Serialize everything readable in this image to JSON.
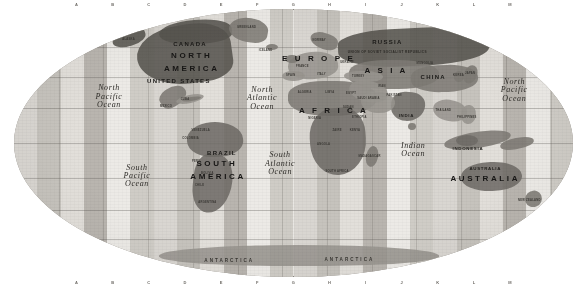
{
  "map": {
    "title": "World Time Zone Map",
    "projection": "Mollweide / elliptical equal-area",
    "background_color": "#ffffff",
    "ocean_base_color": "#e9e7e3",
    "land_color": "#6e6b66",
    "graticule_color": "#5a5854",
    "style": "grayscale photocopy / scanned print"
  },
  "continents": [
    {
      "label": "NORTH",
      "x": 31.8,
      "y": 17.5
    },
    {
      "label": "AMERICA",
      "x": 31.8,
      "y": 22.4
    },
    {
      "label": "SOUTH",
      "x": 36.3,
      "y": 58.0
    },
    {
      "label": "AMERICA",
      "x": 36.5,
      "y": 62.6
    },
    {
      "label": "A F R I C A",
      "x": 57.2,
      "y": 38.0
    },
    {
      "label": "A S I A",
      "x": 66.6,
      "y": 23.2
    },
    {
      "label": "E U R O P E",
      "x": 54.5,
      "y": 18.6
    },
    {
      "label": "AUSTRALIA",
      "x": 84.3,
      "y": 63.3
    }
  ],
  "countries": [
    {
      "label": "CANADA",
      "x": 31.5,
      "y": 13.0,
      "size": "country"
    },
    {
      "label": "UNITED STATES",
      "x": 29.5,
      "y": 27.0,
      "size": "country"
    },
    {
      "label": "RUSSIA",
      "x": 66.8,
      "y": 12.4,
      "size": "country"
    },
    {
      "label": "CHINA",
      "x": 75.0,
      "y": 25.5,
      "size": "country"
    },
    {
      "label": "BRAZIL",
      "x": 37.2,
      "y": 53.6,
      "size": "country"
    },
    {
      "label": "INDONESIA",
      "x": 81.2,
      "y": 52.1,
      "size": "country-sm"
    },
    {
      "label": "AUSTRALIA",
      "x": 84.3,
      "y": 59.6,
      "size": "country-sm"
    },
    {
      "label": "INDIA",
      "x": 70.2,
      "y": 40.0,
      "size": "country-sm"
    },
    {
      "label": "MEXICO",
      "x": 27.2,
      "y": 36.5,
      "size": "tiny"
    },
    {
      "label": "ARGENTINA",
      "x": 34.6,
      "y": 72.4,
      "size": "tiny"
    },
    {
      "label": "JAPAN",
      "x": 81.6,
      "y": 24.1,
      "size": "tiny"
    },
    {
      "label": "ALGERIA",
      "x": 52.0,
      "y": 31.5,
      "size": "tiny"
    },
    {
      "label": "LIBYA",
      "x": 56.5,
      "y": 31.2,
      "size": "tiny"
    },
    {
      "label": "EGYPT",
      "x": 60.3,
      "y": 31.6,
      "size": "tiny"
    },
    {
      "label": "SAUDI ARABIA",
      "x": 63.4,
      "y": 33.6,
      "size": "tiny"
    },
    {
      "label": "IRAN",
      "x": 65.8,
      "y": 29.0,
      "size": "tiny"
    },
    {
      "label": "SUDAN",
      "x": 59.8,
      "y": 37.0,
      "size": "tiny"
    },
    {
      "label": "ZAIRE",
      "x": 57.8,
      "y": 45.5,
      "size": "tiny"
    },
    {
      "label": "ANGOLA",
      "x": 55.4,
      "y": 50.6,
      "size": "tiny"
    },
    {
      "label": "SOUTH AFRICA",
      "x": 57.8,
      "y": 60.7,
      "size": "tiny"
    },
    {
      "label": "MADAGASCAR",
      "x": 63.6,
      "y": 55.2,
      "size": "tiny"
    },
    {
      "label": "NEW ZEALAND",
      "x": 92.2,
      "y": 71.5,
      "size": "tiny"
    },
    {
      "label": "PHILIPPINES",
      "x": 81.0,
      "y": 40.5,
      "size": "tiny"
    },
    {
      "label": "PERU",
      "x": 32.6,
      "y": 57.0,
      "size": "tiny"
    },
    {
      "label": "CHILE",
      "x": 33.2,
      "y": 66.0,
      "size": "tiny"
    },
    {
      "label": "GREENLAND",
      "x": 41.6,
      "y": 7.2,
      "size": "tiny"
    },
    {
      "label": "ICELAND",
      "x": 45.0,
      "y": 15.5,
      "size": "tiny"
    },
    {
      "label": "ALASKA",
      "x": 20.5,
      "y": 11.5,
      "size": "tiny"
    },
    {
      "label": "TURKEY",
      "x": 61.6,
      "y": 25.5,
      "size": "tiny"
    },
    {
      "label": "PAKISTAN",
      "x": 68.0,
      "y": 32.5,
      "size": "tiny"
    },
    {
      "label": "THAILAND",
      "x": 76.8,
      "y": 38.0,
      "size": "tiny"
    },
    {
      "label": "NIGERIA",
      "x": 53.8,
      "y": 41.0,
      "size": "tiny"
    },
    {
      "label": "ETHIOPIA",
      "x": 61.8,
      "y": 40.8,
      "size": "tiny"
    },
    {
      "label": "KENYA",
      "x": 61.0,
      "y": 45.6,
      "size": "tiny"
    },
    {
      "label": "SPAIN",
      "x": 49.5,
      "y": 25.0,
      "size": "tiny"
    },
    {
      "label": "FRANCE",
      "x": 51.6,
      "y": 21.6,
      "size": "tiny"
    },
    {
      "label": "MONGOLIA",
      "x": 73.5,
      "y": 20.4,
      "size": "tiny"
    },
    {
      "label": "KOREA",
      "x": 79.5,
      "y": 25.0,
      "size": "tiny"
    },
    {
      "label": "VENEZUELA",
      "x": 33.4,
      "y": 45.5,
      "size": "tiny"
    },
    {
      "label": "COLOMBIA",
      "x": 31.6,
      "y": 48.5,
      "size": "tiny"
    },
    {
      "label": "BOLIVIA",
      "x": 34.6,
      "y": 61.5,
      "size": "tiny"
    },
    {
      "label": "CUBA",
      "x": 30.6,
      "y": 34.0,
      "size": "tiny"
    },
    {
      "label": "NORWAY",
      "x": 54.6,
      "y": 12.0,
      "size": "tiny"
    },
    {
      "label": "ITALY",
      "x": 55.0,
      "y": 24.5,
      "size": "tiny"
    },
    {
      "label": "UKRAINE",
      "x": 59.6,
      "y": 20.0,
      "size": "tiny"
    }
  ],
  "country_subtitles": [
    {
      "label": "UNION OF SOVIET SOCIALIST REPUBLICS",
      "x": 66.8,
      "y": 16.4
    }
  ],
  "oceans": [
    {
      "lines": [
        "North",
        "Pacific",
        "Ocean"
      ],
      "x": 17.0,
      "y": 33.0,
      "size": "ocean"
    },
    {
      "lines": [
        "South",
        "Pacific",
        "Ocean"
      ],
      "x": 22.0,
      "y": 62.5,
      "size": "ocean"
    },
    {
      "lines": [
        "North",
        "Atlantic",
        "Ocean"
      ],
      "x": 44.4,
      "y": 33.5,
      "size": "ocean"
    },
    {
      "lines": [
        "South",
        "Atlantic",
        "Ocean"
      ],
      "x": 47.6,
      "y": 58.0,
      "size": "ocean"
    },
    {
      "lines": [
        "Indian",
        "Ocean"
      ],
      "x": 71.4,
      "y": 52.5,
      "size": "ocean"
    },
    {
      "lines": [
        "North",
        "Pacific",
        "Ocean"
      ],
      "x": 89.5,
      "y": 30.5,
      "size": "ocean"
    }
  ],
  "polar_labels": [
    {
      "label": "ANTARCTICA",
      "x": 38.5,
      "y": 94.0
    },
    {
      "label": "ANTARCTICA",
      "x": 60.0,
      "y": 93.5
    }
  ],
  "grid_refs": {
    "top": [
      "A",
      "B",
      "C",
      "D",
      "E",
      "F",
      "G",
      "H",
      "I",
      "J",
      "K",
      "L",
      "M"
    ],
    "bottom": [
      "A",
      "B",
      "C",
      "D",
      "E",
      "F",
      "G",
      "H",
      "I",
      "J",
      "K",
      "L",
      "M"
    ]
  },
  "time_zone_bands": {
    "count": 24,
    "shades": [
      "#d9d6d1",
      "#c6c3bd",
      "#e2dfda",
      "#b9b5af",
      "#eceae6",
      "#cfccc6"
    ]
  },
  "graticule": {
    "parallels_pct": [
      14,
      25.5,
      37,
      50,
      63,
      75,
      86
    ],
    "meridians_pct": [
      8,
      16,
      24,
      32,
      40,
      48,
      56,
      64,
      72,
      80,
      88,
      96
    ]
  }
}
